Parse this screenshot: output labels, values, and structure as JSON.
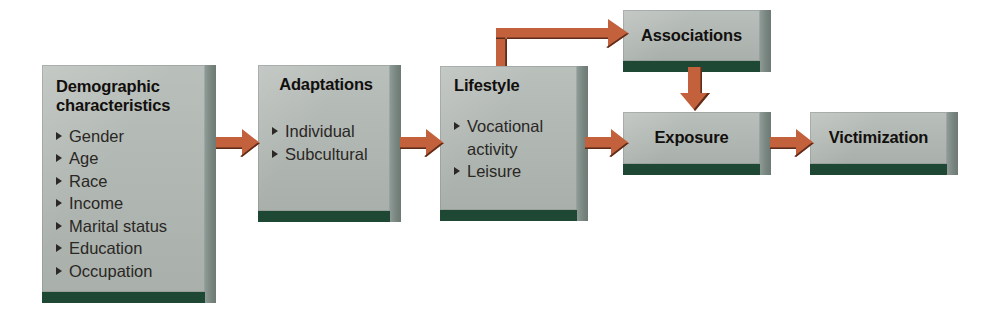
{
  "diagram": {
    "palette": {
      "box_face": "#b3b9b5",
      "box_side": "#79857f",
      "box_bottom": "#1e4734",
      "arrow": "#c3613c",
      "arrow_shadow": "#5e2c1b",
      "background": "#ffffff",
      "text": "#14110f"
    },
    "nodes": [
      {
        "id": "demographic",
        "title": "Demographic\ncharacteristics",
        "title_align": "left",
        "bullets": [
          "Gender",
          "Age",
          "Race",
          "Income",
          "Marital status",
          "Education",
          "Occupation"
        ]
      },
      {
        "id": "adaptations",
        "title": "Adaptations",
        "title_align": "center",
        "bullets": [
          "Individual",
          "Subcultural"
        ]
      },
      {
        "id": "lifestyle",
        "title": "Lifestyle",
        "title_align": "left",
        "bullets": [
          "Vocational\nactivity",
          "Leisure"
        ]
      },
      {
        "id": "associations",
        "title": "Associations",
        "title_align": "center",
        "bullets": []
      },
      {
        "id": "exposure",
        "title": "Exposure",
        "title_align": "center",
        "bullets": []
      },
      {
        "id": "victimization",
        "title": "Victimization",
        "title_align": "center",
        "bullets": []
      }
    ],
    "edges": [
      {
        "id": "demographic-to-adaptations",
        "from": "demographic",
        "to": "adaptations",
        "kind": "arrow-right"
      },
      {
        "id": "adaptations-to-lifestyle",
        "from": "adaptations",
        "to": "lifestyle",
        "kind": "arrow-right"
      },
      {
        "id": "lifestyle-to-exposure",
        "from": "lifestyle",
        "to": "exposure",
        "kind": "arrow-right"
      },
      {
        "id": "exposure-to-victimization",
        "from": "exposure",
        "to": "victimization",
        "kind": "arrow-right"
      },
      {
        "id": "lifestyle-to-associations",
        "from": "lifestyle",
        "to": "associations",
        "kind": "arrow-elbow-up-right"
      },
      {
        "id": "associations-to-exposure",
        "from": "associations",
        "to": "exposure",
        "kind": "arrow-down"
      }
    ]
  }
}
